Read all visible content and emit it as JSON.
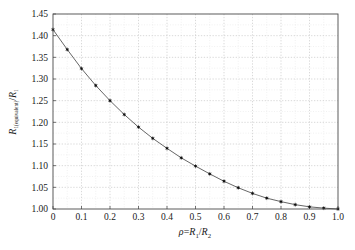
{
  "chart_data": {
    "type": "line",
    "title": "",
    "subtitle": "",
    "xlabel": "ρ=R₁/R₂",
    "ylabel": "R₁(equivalent)/R₁",
    "xlabel_parts": {
      "rho": "ρ",
      "equals": "=",
      "r_main": "R",
      "r_sub1": "1",
      "slash": "/",
      "r_main2": "R",
      "r_sub2": "2"
    },
    "ylabel_parts": {
      "r_main": "R",
      "r_sub1": "1(equivalent)",
      "slash": "/",
      "r_main2": "R",
      "r_sub2": "1"
    },
    "xlim": [
      0,
      1.0
    ],
    "ylim": [
      1.0,
      1.45
    ],
    "xticks": [
      0,
      0.1,
      0.2,
      0.3,
      0.4,
      0.5,
      0.6,
      0.7,
      0.8,
      0.9,
      1.0
    ],
    "xtick_labels": [
      "0",
      "0.1",
      "0.2",
      "0.3",
      "0.4",
      "0.5",
      "0.6",
      "0.7",
      "0.8",
      "0.9",
      "1.0"
    ],
    "yticks": [
      1.0,
      1.05,
      1.1,
      1.15,
      1.2,
      1.25,
      1.3,
      1.35,
      1.4,
      1.45
    ],
    "ytick_labels": [
      "1.00",
      "1.05",
      "1.10",
      "1.15",
      "1.20",
      "1.25",
      "1.30",
      "1.35",
      "1.40",
      "1.45"
    ],
    "grid": true,
    "grid_style": "dotted",
    "grid_color": "#c8c8c8",
    "minor_grid": true,
    "legend": null,
    "legend_position": "none",
    "line_color": "#555555",
    "marker_color": "#111111",
    "marker_style": "star",
    "axis_color": "#4a4a4a",
    "series": [
      {
        "name": "R_equivalent/R_1",
        "x": [
          0.0,
          0.05,
          0.1,
          0.15,
          0.2,
          0.25,
          0.3,
          0.35,
          0.4,
          0.45,
          0.5,
          0.55,
          0.6,
          0.65,
          0.7,
          0.75,
          0.8,
          0.85,
          0.9,
          0.95,
          1.0
        ],
        "y": [
          1.414,
          1.368,
          1.324,
          1.285,
          1.25,
          1.218,
          1.189,
          1.163,
          1.14,
          1.118,
          1.099,
          1.081,
          1.064,
          1.049,
          1.036,
          1.025,
          1.017,
          1.01,
          1.005,
          1.002,
          1.0
        ]
      }
    ]
  }
}
